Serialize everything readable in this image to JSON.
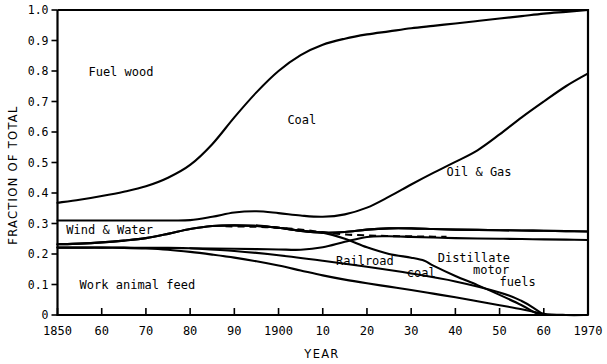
{
  "chart_data": {
    "type": "area",
    "title": "",
    "subtitle": "",
    "xlabel": "YEAR",
    "ylabel": "FRACTION OF TOTAL",
    "xlim": [
      1850,
      1970
    ],
    "ylim": [
      0,
      1.0
    ],
    "grid": false,
    "legend_position": "inline-annotations",
    "x_ticks": [
      {
        "value": 1850,
        "label": "1850"
      },
      {
        "value": 1860,
        "label": "60"
      },
      {
        "value": 1870,
        "label": "70"
      },
      {
        "value": 1880,
        "label": "80"
      },
      {
        "value": 1890,
        "label": "90"
      },
      {
        "value": 1900,
        "label": "1900"
      },
      {
        "value": 1910,
        "label": "10"
      },
      {
        "value": 1920,
        "label": "20"
      },
      {
        "value": 1930,
        "label": "30"
      },
      {
        "value": 1940,
        "label": "40"
      },
      {
        "value": 1950,
        "label": "50"
      },
      {
        "value": 1960,
        "label": "60"
      },
      {
        "value": 1970,
        "label": "1970"
      }
    ],
    "y_ticks": [
      {
        "value": 0.0,
        "label": "0"
      },
      {
        "value": 0.1,
        "label": "0.1"
      },
      {
        "value": 0.2,
        "label": "0.2"
      },
      {
        "value": 0.3,
        "label": "0.3"
      },
      {
        "value": 0.4,
        "label": "0.4"
      },
      {
        "value": 0.5,
        "label": "0.5"
      },
      {
        "value": 0.6,
        "label": "0.6"
      },
      {
        "value": 0.7,
        "label": "0.7"
      },
      {
        "value": 0.8,
        "label": "0.8"
      },
      {
        "value": 0.9,
        "label": "0.9"
      },
      {
        "value": 1.0,
        "label": "1.0"
      }
    ],
    "x": [
      1850,
      1855,
      1860,
      1865,
      1870,
      1875,
      1880,
      1885,
      1890,
      1895,
      1900,
      1905,
      1910,
      1915,
      1920,
      1925,
      1930,
      1935,
      1940,
      1945,
      1950,
      1955,
      1960,
      1965,
      1970
    ],
    "boundaries": [
      {
        "name": "top-of-fuel-wood",
        "style": "solid",
        "comment": "upper boundary of Fuel wood band / lower boundary of Coal band",
        "values": [
          0.368,
          0.378,
          0.39,
          0.404,
          0.422,
          0.45,
          0.492,
          0.56,
          0.648,
          0.73,
          0.8,
          0.852,
          0.886,
          0.906,
          0.92,
          0.93,
          0.94,
          0.948,
          0.956,
          0.964,
          0.972,
          0.98,
          0.988,
          0.994,
          1.0
        ]
      },
      {
        "name": "top-of-oil-and-gas",
        "style": "solid",
        "comment": "boundary between Coal and Oil & Gas bands",
        "values": [
          0.31,
          0.31,
          0.31,
          0.31,
          0.31,
          0.31,
          0.311,
          0.322,
          0.336,
          0.34,
          0.334,
          0.326,
          0.322,
          0.33,
          0.352,
          0.388,
          0.428,
          0.466,
          0.502,
          0.54,
          0.592,
          0.648,
          0.7,
          0.75,
          0.792
        ]
      },
      {
        "name": "top-of-railroad-coal",
        "style": "solid",
        "comment": "upper boundary of the Railroad coal / Distillate motor fuels band",
        "values": [
          0.232,
          0.234,
          0.238,
          0.244,
          0.252,
          0.266,
          0.282,
          0.292,
          0.294,
          0.292,
          0.286,
          0.276,
          0.27,
          0.272,
          0.28,
          0.284,
          0.284,
          0.282,
          0.28,
          0.279,
          0.278,
          0.277,
          0.276,
          0.275,
          0.274
        ]
      },
      {
        "name": "mid-dashed-divider",
        "style": "dashed",
        "comment": "dashed line inside the band, drawn only from ~1888 to ~1938",
        "x_range": [
          1888,
          1938
        ],
        "values": [
          0.291,
          0.29,
          0.288,
          0.284,
          0.278,
          0.27,
          0.264,
          0.261,
          0.259,
          0.258,
          0.257,
          0.256
        ]
      },
      {
        "name": "bottom-of-railroad-coal",
        "style": "solid",
        "comment": "lower boundary of the Railroad coal band / top of Work animal feed band",
        "values": [
          0.221,
          0.221,
          0.221,
          0.221,
          0.22,
          0.22,
          0.219,
          0.218,
          0.217,
          0.216,
          0.215,
          0.214,
          0.222,
          0.24,
          0.256,
          0.258,
          0.256,
          0.254,
          0.252,
          0.251,
          0.25,
          0.249,
          0.248,
          0.247,
          0.246
        ]
      },
      {
        "name": "top-of-work-animal-feed",
        "style": "solid",
        "comment": "declining curve that reaches zero near 1960",
        "values": [
          0.221,
          0.221,
          0.221,
          0.22,
          0.218,
          0.214,
          0.207,
          0.198,
          0.188,
          0.176,
          0.162,
          0.146,
          0.13,
          0.116,
          0.104,
          0.093,
          0.082,
          0.07,
          0.058,
          0.045,
          0.032,
          0.019,
          0.004,
          0.0,
          0.0
        ]
      },
      {
        "name": "railroad-coal-lower-decline",
        "style": "solid",
        "comment": "the Railroad coal lower envelope falling to zero near 1958",
        "values": [
          0.232,
          0.234,
          0.238,
          0.244,
          0.252,
          0.266,
          0.282,
          0.292,
          0.294,
          0.292,
          0.286,
          0.276,
          0.27,
          0.272,
          0.28,
          0.284,
          0.284,
          0.282,
          0.28,
          0.279,
          0.278,
          0.277,
          0.276,
          0.275,
          0.274
        ]
      }
    ],
    "series_labels": [
      {
        "name": "fuel-wood",
        "text": "Fuel wood",
        "x": 1857,
        "y": 0.785
      },
      {
        "name": "coal",
        "text": "Coal",
        "x": 1902,
        "y": 0.625
      },
      {
        "name": "oil-and-gas",
        "text": "Oil & Gas",
        "x": 1938,
        "y": 0.455
      },
      {
        "name": "wind-and-water",
        "text": "Wind & Water",
        "x": 1852,
        "y": 0.265
      },
      {
        "name": "work-animal-feed",
        "text": "Work animal feed",
        "x": 1855,
        "y": 0.085
      },
      {
        "name": "railroad",
        "text": "Railroad",
        "x": 1913,
        "y": 0.165
      },
      {
        "name": "railroad-coal",
        "text": "coal",
        "x": 1929,
        "y": 0.125
      },
      {
        "name": "distillate",
        "text": "Distillate",
        "x": 1936,
        "y": 0.175
      },
      {
        "name": "motor",
        "text": "motor",
        "x": 1944,
        "y": 0.135
      },
      {
        "name": "fuels",
        "text": "fuels",
        "x": 1950,
        "y": 0.095
      }
    ]
  },
  "colors": {
    "background": "#ffffff",
    "ink": "#000000"
  }
}
